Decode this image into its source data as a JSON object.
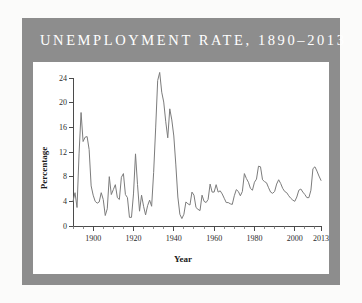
{
  "figure": {
    "title": "UNEMPLOYMENT RATE, 1890–2013",
    "frame_color": "#8d8d8d",
    "title_color": "#ffffff",
    "background_color": "#ffffff",
    "page_background": "#fbfbfa"
  },
  "chart_data": {
    "type": "line",
    "title": "UNEMPLOYMENT RATE, 1890–2013",
    "xlabel": "Year",
    "ylabel": "Percentage",
    "xlim": [
      1890,
      2013
    ],
    "ylim": [
      0,
      24
    ],
    "grid": false,
    "legend": null,
    "line_color": "#7c7c7c",
    "y_ticks": [
      0,
      4,
      8,
      12,
      16,
      20,
      24
    ],
    "y_tick_labels": [
      "0",
      "4",
      "8",
      "12",
      "16",
      "20",
      "24"
    ],
    "x_ticks": [
      1900,
      1920,
      1940,
      1960,
      1980,
      2000,
      2013
    ],
    "x_tick_labels": [
      "1900",
      "1920",
      "1940",
      "1960",
      "1980",
      "2000",
      "2013"
    ],
    "x_minor_tick_interval": 5,
    "series_name": "Unemployment rate",
    "x": [
      1890,
      1891,
      1892,
      1893,
      1894,
      1895,
      1896,
      1897,
      1898,
      1899,
      1900,
      1901,
      1902,
      1903,
      1904,
      1905,
      1906,
      1907,
      1908,
      1909,
      1910,
      1911,
      1912,
      1913,
      1914,
      1915,
      1916,
      1917,
      1918,
      1919,
      1920,
      1921,
      1922,
      1923,
      1924,
      1925,
      1926,
      1927,
      1928,
      1929,
      1930,
      1931,
      1932,
      1933,
      1934,
      1935,
      1936,
      1937,
      1938,
      1939,
      1940,
      1941,
      1942,
      1943,
      1944,
      1945,
      1946,
      1947,
      1948,
      1949,
      1950,
      1951,
      1952,
      1953,
      1954,
      1955,
      1956,
      1957,
      1958,
      1959,
      1960,
      1961,
      1962,
      1963,
      1964,
      1965,
      1966,
      1967,
      1968,
      1969,
      1970,
      1971,
      1972,
      1973,
      1974,
      1975,
      1976,
      1977,
      1978,
      1979,
      1980,
      1981,
      1982,
      1983,
      1984,
      1985,
      1986,
      1987,
      1988,
      1989,
      1990,
      1991,
      1992,
      1993,
      1994,
      1995,
      1996,
      1997,
      1998,
      1999,
      2000,
      2001,
      2002,
      2003,
      2004,
      2005,
      2006,
      2007,
      2008,
      2009,
      2010,
      2011,
      2012,
      2013
    ],
    "values": [
      4.0,
      5.4,
      3.0,
      11.7,
      18.4,
      13.7,
      14.4,
      14.5,
      12.4,
      6.5,
      5.0,
      4.0,
      3.7,
      3.9,
      5.4,
      4.3,
      1.7,
      2.8,
      8.0,
      5.1,
      5.9,
      6.7,
      4.6,
      4.3,
      7.9,
      8.5,
      5.1,
      4.6,
      1.4,
      1.4,
      5.2,
      11.7,
      6.7,
      2.4,
      5.0,
      3.2,
      1.8,
      3.3,
      4.2,
      3.2,
      8.7,
      15.9,
      23.6,
      24.9,
      21.7,
      20.1,
      16.9,
      14.3,
      19.0,
      17.2,
      14.6,
      9.9,
      4.7,
      1.9,
      1.2,
      1.9,
      3.9,
      3.6,
      3.4,
      5.5,
      5.0,
      3.0,
      2.7,
      2.5,
      5.0,
      4.0,
      3.8,
      4.3,
      6.8,
      5.5,
      5.5,
      6.7,
      5.5,
      5.7,
      5.2,
      4.5,
      3.8,
      3.8,
      3.6,
      3.5,
      4.9,
      5.9,
      5.6,
      4.9,
      5.6,
      8.5,
      7.7,
      7.1,
      6.1,
      5.8,
      7.1,
      7.6,
      9.7,
      9.6,
      7.5,
      7.2,
      7.0,
      6.2,
      5.5,
      5.3,
      5.6,
      6.8,
      7.5,
      6.9,
      6.1,
      5.6,
      5.4,
      4.9,
      4.5,
      4.2,
      4.0,
      4.7,
      5.8,
      6.0,
      5.5,
      5.1,
      4.6,
      4.6,
      5.8,
      9.3,
      9.6,
      8.9,
      8.1,
      7.4
    ]
  }
}
